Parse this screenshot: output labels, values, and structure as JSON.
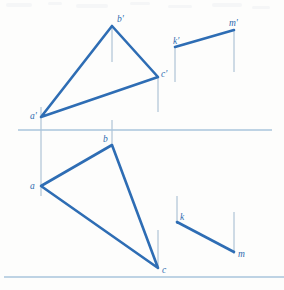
{
  "figure": {
    "kind": "orthographic-projection-drawing",
    "width": 284,
    "height": 290,
    "background_color": "#fdfdfc",
    "line_color": "#2e6db4",
    "projector_color": "#9fb8ce",
    "reference_line_color": "#a8c4dd",
    "label_color": "#2f6cb0"
  },
  "reference_lines": [
    {
      "name": "folding-line-middle",
      "x1": 18,
      "y1": 130,
      "x2": 272,
      "y2": 130
    },
    {
      "name": "folding-line-bottom",
      "x1": 4,
      "y1": 277,
      "x2": 284,
      "y2": 277
    }
  ],
  "front_view": {
    "name": "front-view",
    "triangle": {
      "name": "triangle-a-b-c-front",
      "vertices": [
        {
          "id": "a-prime",
          "label": "a'",
          "x": 41,
          "y": 117,
          "label_x": 30,
          "label_y": 115
        },
        {
          "id": "b-prime",
          "label": "b'",
          "x": 112,
          "y": 26,
          "label_x": 117,
          "label_y": 21
        },
        {
          "id": "c-prime",
          "label": "c'",
          "x": 158,
          "y": 77,
          "label_x": 161,
          "label_y": 75
        }
      ],
      "edges": [
        {
          "from": "a-prime",
          "to": "b-prime"
        },
        {
          "from": "b-prime",
          "to": "c-prime"
        },
        {
          "from": "c-prime",
          "to": "a-prime"
        }
      ]
    },
    "line_km": {
      "name": "line-k-m-front",
      "points": [
        {
          "id": "k-prime",
          "label": "k'",
          "x": 175,
          "y": 47,
          "label_x": 174,
          "label_y": 42
        },
        {
          "id": "m-prime",
          "label": "m'",
          "x": 234,
          "y": 30,
          "label_x": 230,
          "label_y": 24
        }
      ]
    }
  },
  "top_view": {
    "name": "top-view",
    "triangle": {
      "name": "triangle-a-b-c-top",
      "vertices": [
        {
          "id": "a",
          "label": "a",
          "x": 41,
          "y": 186,
          "label_x": 31,
          "label_y": 187
        },
        {
          "id": "b",
          "label": "b",
          "x": 112,
          "y": 145,
          "label_x": 104,
          "label_y": 141
        },
        {
          "id": "c",
          "label": "c",
          "x": 158,
          "y": 268,
          "label_x": 162,
          "label_y": 272
        }
      ],
      "edges": [
        {
          "from": "a",
          "to": "b"
        },
        {
          "from": "b",
          "to": "c"
        },
        {
          "from": "c",
          "to": "a"
        }
      ]
    },
    "line_km": {
      "name": "line-k-m-top",
      "points": [
        {
          "id": "k",
          "label": "k",
          "x": 177,
          "y": 222,
          "label_x": 180,
          "label_y": 219
        },
        {
          "id": "m",
          "label": "m",
          "x": 234,
          "y": 252,
          "label_x": 238,
          "label_y": 256
        }
      ]
    }
  },
  "projectors": [
    {
      "name": "projector-a",
      "x": 41,
      "y1": 117,
      "y2": 186
    },
    {
      "name": "projector-b",
      "x": 112,
      "y1": 26,
      "y2": 145
    },
    {
      "name": "projector-c",
      "x": 158,
      "y1": 77,
      "y2": 268
    },
    {
      "name": "projector-k",
      "x": 175,
      "y1": 47,
      "y2": 222
    },
    {
      "name": "projector-m",
      "x": 234,
      "y1": 30,
      "y2": 252
    }
  ]
}
